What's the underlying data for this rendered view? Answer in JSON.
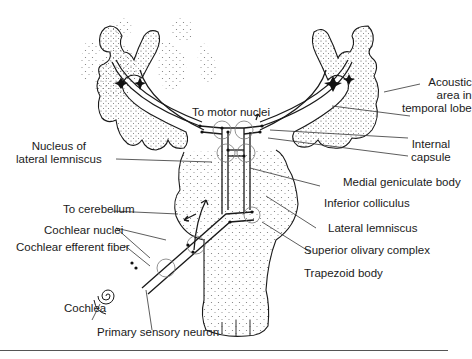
{
  "figure": {
    "labels": {
      "acoustic_area": [
        "Acoustic",
        "area in",
        "temporal lobe"
      ],
      "to_motor_nuclei": "To motor nuclei",
      "internal_capsule": [
        "Internal",
        "capsule"
      ],
      "nucleus_lateral_lemniscus": [
        "Nucleus of",
        "lateral lemniscus"
      ],
      "medial_geniculate_body": "Medial geniculate body",
      "inferior_colliculus": "Inferior colliculus",
      "to_cerebellum": "To cerebellum",
      "lateral_lemniscus": "Lateral lemniscus",
      "cochlear_nuclei": "Cochlear nuclei",
      "superior_olivary_complex": "Superior olivary complex",
      "cochlear_efferent_fiber": "Cochlear efferent fiber",
      "trapezoid_body": "Trapezoid body",
      "cochlea": "Cochlea",
      "primary_sensory_neuron": "Primary sensory neuron"
    },
    "colors": {
      "ink": "#1a1a1a",
      "stipple": "#555555",
      "background": "#ffffff"
    }
  }
}
